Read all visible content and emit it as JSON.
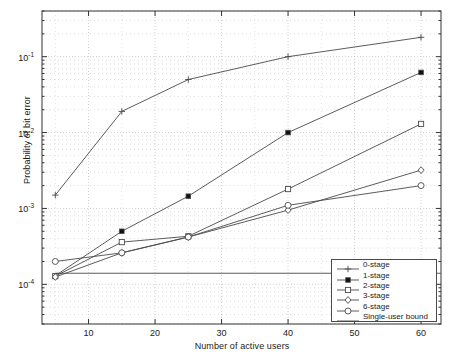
{
  "chart_data": {
    "type": "line",
    "title": "",
    "xlabel": "Number of active users",
    "ylabel": "Probability of bit error",
    "xlim": [
      3,
      63
    ],
    "ylim": [
      3e-05,
      0.4
    ],
    "yscale": "log",
    "xscale": "linear",
    "grid": true,
    "grid_style": "dotted",
    "legend_position": "lower right",
    "xticks": [
      10,
      20,
      30,
      40,
      50,
      60
    ],
    "xtick_labels": [
      "10",
      "20",
      "30",
      "40",
      "50",
      "60"
    ],
    "yticks": [
      0.1,
      0.01,
      0.001,
      0.0001
    ],
    "ytick_labels": [
      "10-1",
      "10-2",
      "10-3",
      "10-4"
    ],
    "ytick_mantissa": "10",
    "ytick_exponents": [
      "-1",
      "-2",
      "-3",
      "-4"
    ],
    "x": [
      5,
      15,
      25,
      40,
      60
    ],
    "series": [
      {
        "name": "0-stage",
        "marker": "plus",
        "values": [
          0.0015,
          0.019,
          0.05,
          0.1,
          0.18
        ]
      },
      {
        "name": "1-stage",
        "marker": "filled-square",
        "values": [
          0.00013,
          0.0005,
          0.00145,
          0.01,
          0.062
        ]
      },
      {
        "name": "2-stage",
        "marker": "open-square",
        "values": [
          0.000128,
          0.00036,
          0.00043,
          0.0018,
          0.013
        ]
      },
      {
        "name": "3-stage",
        "marker": "open-diamond",
        "values": [
          0.000125,
          0.00026,
          0.00042,
          0.00095,
          0.0032
        ]
      },
      {
        "name": "6-stage",
        "marker": "open-circle",
        "values": [
          0.0002,
          0.00026,
          0.00042,
          0.0011,
          0.002
        ]
      },
      {
        "name": "Single-user bound",
        "marker": "none",
        "constant": 0.00014,
        "values": [
          0.00014,
          0.00014,
          0.00014,
          0.00014,
          0.00014
        ]
      }
    ],
    "colors": {
      "line": "#4a4a4a",
      "grid": "#c8c8c8",
      "axis": "#333333",
      "background": "#ffffff"
    }
  },
  "legend": {
    "items": [
      {
        "label": "0-stage",
        "marker": "plus-marker"
      },
      {
        "label": "1-stage",
        "marker": "filled-square-marker"
      },
      {
        "label": "2-stage",
        "marker": "open-square-marker"
      },
      {
        "label": "3-stage",
        "marker": "open-diamond-marker"
      },
      {
        "label": "6-stage",
        "marker": "open-circle-marker"
      },
      {
        "label": "Single-user bound",
        "marker": "plain-line-marker"
      }
    ]
  }
}
